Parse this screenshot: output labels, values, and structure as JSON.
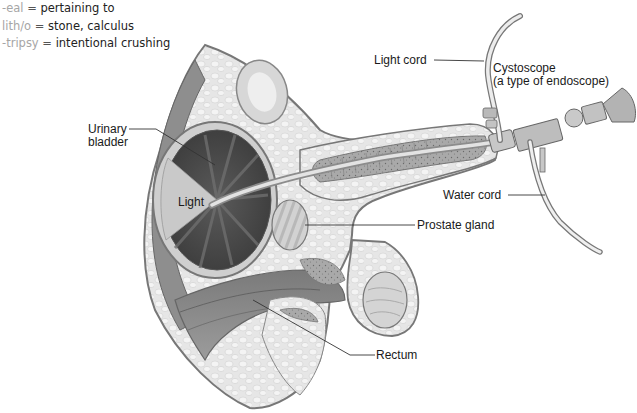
{
  "glossary": [
    {
      "term": "-eal",
      "eq": "=",
      "definition": "pertaining to"
    },
    {
      "term": "lith/o",
      "eq": "=",
      "definition": "stone, calculus"
    },
    {
      "term": "-tripsy",
      "eq": "=",
      "definition": "intentional crushing"
    }
  ],
  "labels": {
    "light_cord": "Light cord",
    "cystoscope_line1": "Cystoscope",
    "cystoscope_line2": "(a type of endoscope)",
    "urinary_bladder_line1": "Urinary",
    "urinary_bladder_line2": "bladder",
    "light": "Light",
    "water_cord": "Water cord",
    "prostate_gland": "Prostate gland",
    "rectum": "Rectum"
  },
  "colors": {
    "term_gray": "#a6a6a6",
    "tissue_light": "#e4e4e4",
    "tissue_mid": "#c8c8c8",
    "tissue_dark": "#8a8a8a",
    "bladder_dark": "#4a4a4a",
    "outline": "#6e6e6e"
  }
}
